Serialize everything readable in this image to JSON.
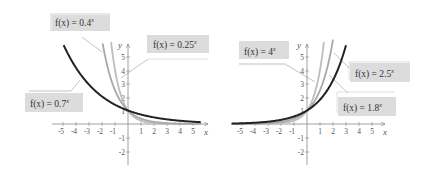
{
  "chart_data": [
    {
      "type": "line",
      "title": "Decreasing exponential functions",
      "xlabel": "x",
      "ylabel": "y",
      "xlim": [
        -5.5,
        5.5
      ],
      "ylim": [
        -2.5,
        6
      ],
      "x_ticks": [
        "-5",
        "-4",
        "-3",
        "-2",
        "-1",
        "1",
        "2",
        "3",
        "4",
        "5"
      ],
      "y_ticks": [
        "-2",
        "-1",
        "1",
        "2",
        "3",
        "4",
        "5"
      ],
      "series": [
        {
          "name": "f(x) = 0.7^x",
          "base": 0.7,
          "color": "#222222",
          "x": [
            -5,
            -4,
            -3,
            -2,
            -1,
            0,
            1,
            2,
            3,
            4,
            5
          ],
          "values": [
            5.95,
            4.16,
            2.92,
            2.04,
            1.43,
            1,
            0.7,
            0.49,
            0.34,
            0.24,
            0.17
          ]
        },
        {
          "name": "f(x) = 0.4^x",
          "base": 0.4,
          "color": "#aaaaaa",
          "x": [
            -2,
            -1,
            0,
            1,
            2,
            3,
            4,
            5
          ],
          "values": [
            6.25,
            2.5,
            1,
            0.4,
            0.16,
            0.06,
            0.03,
            0.01
          ]
        },
        {
          "name": "f(x) = 0.25^x",
          "base": 0.25,
          "color": "#bbbbbb",
          "x": [
            -1.3,
            -1,
            0,
            1,
            2,
            3,
            4,
            5
          ],
          "values": [
            6.06,
            4,
            1,
            0.25,
            0.06,
            0.02,
            0.0,
            0.0
          ]
        }
      ]
    },
    {
      "type": "line",
      "title": "Increasing exponential functions",
      "xlabel": "x",
      "ylabel": "y",
      "xlim": [
        -5.5,
        5.5
      ],
      "ylim": [
        -2.5,
        6
      ],
      "x_ticks": [
        "-5",
        "-4",
        "-3",
        "-2",
        "-1",
        "1",
        "2",
        "3",
        "4",
        "5"
      ],
      "y_ticks": [
        "-2",
        "-1",
        "1",
        "2",
        "3",
        "4",
        "5"
      ],
      "series": [
        {
          "name": "f(x) = 1.8^x",
          "base": 1.8,
          "color": "#222222",
          "x": [
            -5,
            -4,
            -3,
            -2,
            -1,
            0,
            1,
            2,
            3
          ],
          "values": [
            0.05,
            0.1,
            0.17,
            0.31,
            0.56,
            1,
            1.8,
            3.24,
            5.83
          ]
        },
        {
          "name": "f(x) = 2.5^x",
          "base": 2.5,
          "color": "#aaaaaa",
          "x": [
            -5,
            -4,
            -3,
            -2,
            -1,
            0,
            1,
            2
          ],
          "values": [
            0.01,
            0.03,
            0.06,
            0.16,
            0.4,
            1,
            2.5,
            6.25
          ]
        },
        {
          "name": "f(x) = 4^x",
          "base": 4,
          "color": "#bbbbbb",
          "x": [
            -5,
            -4,
            -3,
            -2,
            -1,
            0,
            1,
            1.3
          ],
          "values": [
            0.0,
            0.0,
            0.02,
            0.06,
            0.25,
            1,
            4,
            6.06
          ]
        }
      ]
    }
  ],
  "left": {
    "labels": [
      {
        "id": "l04",
        "prefix": "f(x) = 0.4",
        "sup": "x"
      },
      {
        "id": "l025",
        "prefix": "f(x) = 0.25",
        "sup": "x"
      },
      {
        "id": "l07",
        "prefix": "f(x) = 0.7",
        "sup": "x"
      }
    ],
    "x_axis_label": "x",
    "y_axis_label": "y"
  },
  "right": {
    "labels": [
      {
        "id": "r4",
        "prefix": "f(x) = 4",
        "sup": "x"
      },
      {
        "id": "r25",
        "prefix": "f(x) = 2.5",
        "sup": "x"
      },
      {
        "id": "r18",
        "prefix": "f(x) = 1.8",
        "sup": "x"
      }
    ],
    "x_axis_label": "x",
    "y_axis_label": "y"
  },
  "ticks": {
    "x": [
      "-5",
      "-4",
      "-3",
      "-2",
      "-1",
      "1",
      "2",
      "3",
      "4",
      "5"
    ],
    "y": [
      "5",
      "4",
      "3",
      "2",
      "1",
      "-1",
      "-2"
    ]
  }
}
